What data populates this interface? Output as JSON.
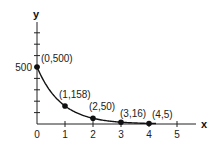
{
  "chart_data": {
    "type": "line",
    "title": "",
    "xlabel": "x",
    "ylabel": "y",
    "x": [
      0,
      1,
      2,
      3,
      4
    ],
    "series": [
      {
        "name": "exponential decay",
        "values": [
          500,
          158,
          50,
          16,
          5
        ]
      }
    ],
    "point_labels": [
      "(0,500)",
      "(1,158)",
      "(2,50)",
      "(3,16)",
      "(4,5)"
    ],
    "x_ticks": [
      "0",
      "1",
      "2",
      "3",
      "4",
      "5"
    ],
    "y_tick_labels": [
      "500"
    ],
    "y_tick_step": 100,
    "xlim": [
      0,
      5.6
    ],
    "ylim": [
      0,
      800
    ],
    "grid": false,
    "legend": "none"
  }
}
